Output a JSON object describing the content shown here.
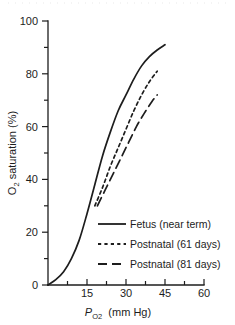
{
  "chart_data": {
    "type": "line",
    "title": "",
    "xlabel": "P_O2 (mm Hg)",
    "ylabel": "O2 saturation (%)",
    "xlim": [
      0,
      60
    ],
    "ylim": [
      0,
      100
    ],
    "grid": false,
    "legend_position": "inside-lower-right",
    "xticks": [
      15,
      30,
      45,
      60
    ],
    "xminorticks": [
      7.5,
      22.5,
      37.5,
      52.5
    ],
    "yticks": [
      0,
      20,
      40,
      60,
      80,
      100
    ],
    "yminorticks": [
      10,
      30,
      50,
      70,
      90
    ],
    "series": [
      {
        "name": "Fetus (near term)",
        "style": "solid",
        "x": [
          0,
          3,
          6,
          9,
          12,
          15,
          18,
          21,
          24,
          27,
          30,
          33,
          36,
          39,
          42,
          45
        ],
        "y": [
          0,
          2,
          5,
          10,
          17,
          27,
          38,
          49,
          58,
          66,
          72,
          78,
          83,
          86.5,
          89,
          91
        ]
      },
      {
        "name": "Postnatal (61 days)",
        "style": "short-dash",
        "x": [
          18,
          21,
          24,
          27,
          30,
          33,
          36,
          39,
          42
        ],
        "y": [
          30,
          37,
          45,
          52,
          59,
          66,
          72,
          77,
          81
        ]
      },
      {
        "name": "Postnatal (81 days)",
        "style": "long-dash",
        "x": [
          19,
          22,
          25,
          28,
          31,
          34,
          37,
          40,
          42
        ],
        "y": [
          30,
          36,
          42,
          48,
          54,
          60,
          65,
          69.5,
          72
        ]
      }
    ]
  },
  "axes": {
    "y_title_main": "O",
    "y_title_sub": "2",
    "y_title_rest": " saturation (%)",
    "x_title_p": "P",
    "x_title_sub_o": "O",
    "x_title_sub_2": "2",
    "x_title_unit": "(mm Hg)",
    "ytick_labels": [
      "0",
      "20",
      "40",
      "60",
      "80",
      "100"
    ],
    "xtick_labels": [
      "15",
      "30",
      "45",
      "60"
    ]
  },
  "legend": {
    "entries": [
      {
        "label": "Fetus (near term)",
        "style": "solid"
      },
      {
        "label": "Postnatal (61 days)",
        "style": "short-dash"
      },
      {
        "label": "Postnatal (81 days)",
        "style": "long-dash"
      }
    ]
  },
  "colors": {
    "ink": "#1d1d1d",
    "background": "#ffffff",
    "artifact": "#d9d9d9"
  }
}
